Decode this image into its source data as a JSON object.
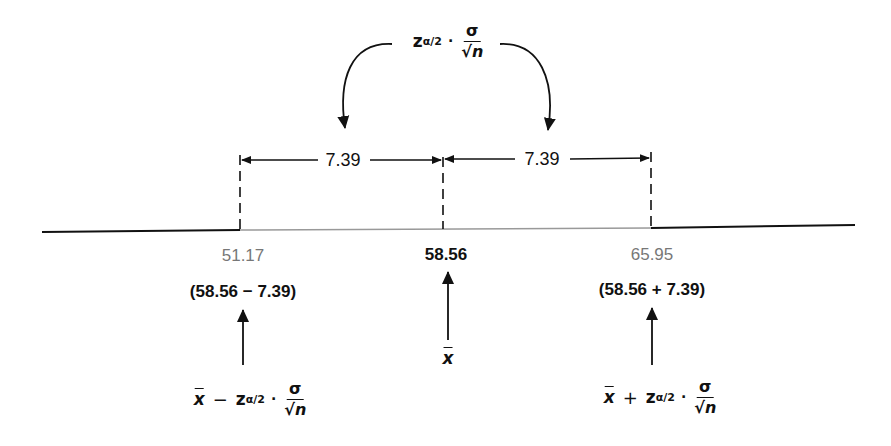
{
  "diagram": {
    "type": "confidence-interval-number-line",
    "top_formula": {
      "z_symbol": "z",
      "subscript": "α/2",
      "dot": "·",
      "numerator": "σ",
      "denominator_root": "√",
      "denominator_var": "n"
    },
    "distances": {
      "left": "7.39",
      "right": "7.39"
    },
    "axis_points": {
      "lower": {
        "value": "51.17",
        "expression": "(58.56 − 7.39)"
      },
      "center": {
        "value": "58.56",
        "label": "x"
      },
      "upper": {
        "value": "65.95",
        "expression": "(58.56 + 7.39)"
      }
    },
    "bottom_formulas": {
      "lower": {
        "xbar": "x",
        "operator": "−",
        "z_symbol": "z",
        "subscript": "α/2",
        "dot": "·",
        "numerator": "σ",
        "denominator_root": "√",
        "denominator_var": "n"
      },
      "upper": {
        "xbar": "x",
        "operator": "+",
        "z_symbol": "z",
        "subscript": "α/2",
        "dot": "·",
        "numerator": "σ",
        "denominator_root": "√",
        "denominator_var": "n"
      }
    },
    "colors": {
      "line": "#111111",
      "grey_value": "#777777",
      "interval_segment": "#999999"
    }
  }
}
